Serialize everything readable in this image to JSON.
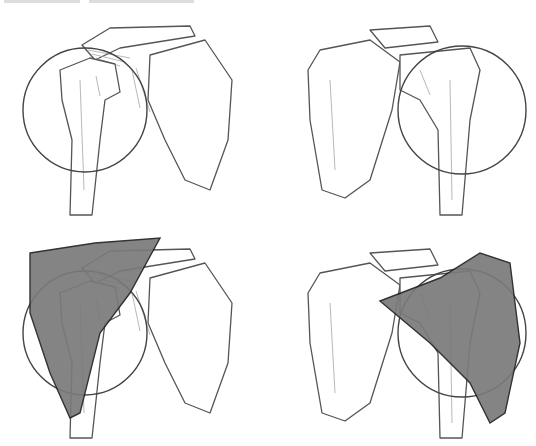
{
  "figure": {
    "panels": [
      {
        "id": "front-view",
        "position": "top-left",
        "muscle_shaded": false
      },
      {
        "id": "back-view",
        "position": "top-right",
        "muscle_shaded": false
      },
      {
        "id": "front-view-deltoid",
        "position": "bottom-left",
        "muscle_shaded": true
      },
      {
        "id": "back-view-deltoid",
        "position": "bottom-right",
        "muscle_shaded": true
      }
    ],
    "colors": {
      "line": "#555555",
      "circle": "#444444",
      "muscle_fill": "#7a7a7a",
      "background": "#ffffff"
    }
  }
}
